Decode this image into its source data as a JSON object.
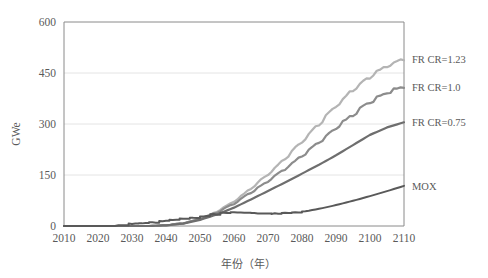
{
  "chart_data": {
    "type": "line",
    "title": "",
    "xlabel": "年份（年）",
    "ylabel": "GWe",
    "xlim": [
      2010,
      2110
    ],
    "ylim": [
      0,
      600
    ],
    "grid": true,
    "grid_axis": "y",
    "legend_position": "right-of-plot-inline",
    "xticks": [
      2010,
      2020,
      2030,
      2040,
      2050,
      2060,
      2070,
      2080,
      2090,
      2100,
      2110
    ],
    "yticks": [
      0,
      150,
      300,
      450,
      600
    ],
    "x": [
      2010,
      2015,
      2020,
      2025,
      2030,
      2035,
      2040,
      2045,
      2050,
      2055,
      2060,
      2065,
      2070,
      2075,
      2080,
      2085,
      2090,
      2095,
      2100,
      2105,
      2110
    ],
    "series": [
      {
        "name": "FR CR=1.23",
        "color": "#b4b4b4",
        "label": "FR CR=1.23",
        "label_value": 490,
        "style": "wavy-rising",
        "values": [
          0,
          0,
          0,
          0,
          0,
          0,
          2,
          8,
          20,
          42,
          72,
          110,
          152,
          198,
          248,
          300,
          352,
          400,
          440,
          470,
          490
        ]
      },
      {
        "name": "FR CR=1.0",
        "color": "#8c8c8c",
        "label": "FR CR=1.0",
        "label_value": 410,
        "style": "wavy-rising",
        "values": [
          0,
          0,
          0,
          0,
          0,
          0,
          2,
          8,
          20,
          40,
          66,
          98,
          132,
          168,
          206,
          246,
          288,
          328,
          366,
          392,
          410
        ]
      },
      {
        "name": "FR CR=0.75",
        "color": "#6e6e6e",
        "label": "FR CR=0.75",
        "label_value": 305,
        "style": "smooth-rising",
        "values": [
          0,
          0,
          0,
          0,
          0,
          0,
          2,
          7,
          18,
          34,
          54,
          78,
          103,
          128,
          154,
          180,
          208,
          238,
          268,
          290,
          305
        ]
      },
      {
        "name": "MOX",
        "color": "#595959",
        "label": "MOX",
        "label_value": 118,
        "style": "stepped-then-smooth",
        "values": [
          0,
          0,
          0,
          1,
          8,
          10,
          18,
          22,
          28,
          38,
          40,
          38,
          36,
          38,
          42,
          50,
          62,
          76,
          92,
          106,
          118
        ]
      }
    ]
  },
  "axis": {
    "y_title": "GWe",
    "x_title": "年份（年）",
    "y_tick_labels": [
      "0",
      "150",
      "300",
      "450",
      "600"
    ],
    "x_tick_labels": [
      "2010",
      "2020",
      "2030",
      "2040",
      "2050",
      "2060",
      "2070",
      "2080",
      "2090",
      "2100",
      "2110"
    ]
  },
  "labels": {
    "fr_cr_123": "FR CR=1.23",
    "fr_cr_10": "FR CR=1.0",
    "fr_cr_075": "FR CR=0.75",
    "mox": "MOX"
  },
  "colors": {
    "background": "#ffffff",
    "axis": "#808080",
    "grid": "#e4e4e4",
    "text": "#5a5a5a",
    "series_light": "#b4b4b4",
    "series_mid": "#8c8c8c",
    "series_dark": "#6e6e6e",
    "series_darkest": "#595959"
  }
}
